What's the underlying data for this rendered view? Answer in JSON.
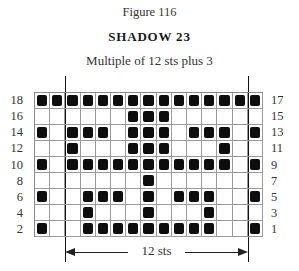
{
  "figure": {
    "label": "Figure 116",
    "title": "SHADOW 23",
    "subtitle": "Multiple of 12 sts plus 3"
  },
  "chart": {
    "columns": 15,
    "rows": [
      {
        "left_label": "18",
        "right_label": "17",
        "cells": [
          1,
          1,
          1,
          1,
          1,
          1,
          1,
          1,
          1,
          1,
          1,
          1,
          1,
          1,
          1
        ]
      },
      {
        "left_label": "16",
        "right_label": "15",
        "cells": [
          0,
          0,
          0,
          0,
          0,
          0,
          1,
          1,
          1,
          0,
          0,
          0,
          0,
          0,
          0
        ]
      },
      {
        "left_label": "14",
        "right_label": "13",
        "cells": [
          1,
          0,
          1,
          1,
          1,
          0,
          1,
          1,
          1,
          0,
          1,
          1,
          1,
          0,
          1
        ]
      },
      {
        "left_label": "12",
        "right_label": "11",
        "cells": [
          0,
          0,
          1,
          0,
          0,
          0,
          1,
          1,
          1,
          0,
          0,
          0,
          1,
          0,
          0
        ]
      },
      {
        "left_label": "10",
        "right_label": "9",
        "cells": [
          1,
          0,
          1,
          1,
          1,
          1,
          1,
          1,
          1,
          1,
          1,
          1,
          1,
          0,
          1
        ]
      },
      {
        "left_label": "8",
        "right_label": "7",
        "cells": [
          0,
          0,
          0,
          0,
          0,
          0,
          0,
          1,
          0,
          0,
          0,
          0,
          0,
          0,
          0
        ]
      },
      {
        "left_label": "6",
        "right_label": "5",
        "cells": [
          1,
          0,
          0,
          1,
          1,
          1,
          0,
          1,
          0,
          1,
          1,
          1,
          0,
          0,
          1
        ]
      },
      {
        "left_label": "4",
        "right_label": "3",
        "cells": [
          0,
          0,
          0,
          1,
          0,
          0,
          0,
          1,
          0,
          0,
          0,
          1,
          0,
          0,
          0
        ]
      },
      {
        "left_label": "2",
        "right_label": "1",
        "cells": [
          1,
          0,
          0,
          1,
          1,
          1,
          1,
          1,
          1,
          1,
          1,
          1,
          0,
          0,
          1
        ]
      }
    ],
    "repeat_label": "12 sts",
    "filled_color": "#0d0d0d",
    "grid_color": "#9a9a9a"
  }
}
